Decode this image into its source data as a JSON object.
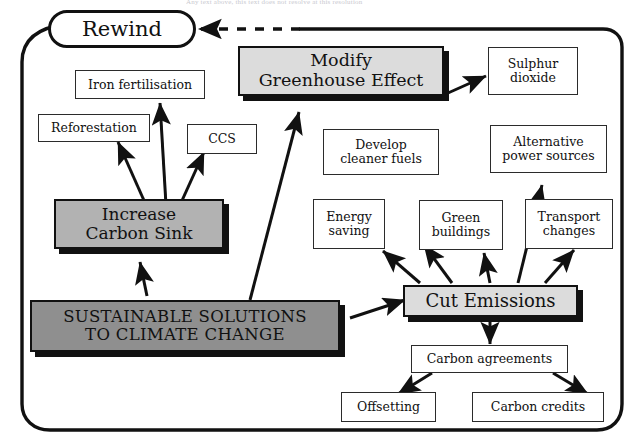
{
  "diagram": {
    "title_text": "SUSTAINABLE SOLUTIONS TO CLIMATE CHANGE",
    "top_partial_text": "Any text above, this text does not resolve at this resolution",
    "rewind_label": "Rewind",
    "colors": {
      "ink": "#111111",
      "box_white": "#ffffff",
      "tone_light": "#dcdcdc",
      "tone_mid": "#b2b2b2",
      "tone_dark": "#8f8f8f",
      "background": "#ffffff"
    },
    "nodes": {
      "modify_greenhouse": "Modify\nGreenhouse Effect",
      "modify_greenhouse_line1": "Modify",
      "modify_greenhouse_line2": "Greenhouse Effect",
      "sulphur_dioxide_line1": "Sulphur",
      "sulphur_dioxide_line2": "dioxide",
      "iron_fertilisation": "Iron fertilisation",
      "reforestation": "Reforestation",
      "ccs": "CCS",
      "increase_carbon_sink_line1": "Increase",
      "increase_carbon_sink_line2": "Carbon Sink",
      "main_line1": "SUSTAINABLE SOLUTIONS",
      "main_line2": "TO CLIMATE CHANGE",
      "develop_cleaner_fuels_line1": "Develop",
      "develop_cleaner_fuels_line2": "cleaner fuels",
      "alternative_power_line1": "Alternative",
      "alternative_power_line2": "power sources",
      "energy_saving_line1": "Energy",
      "energy_saving_line2": "saving",
      "green_buildings_line1": "Green",
      "green_buildings_line2": "buildings",
      "transport_changes_line1": "Transport",
      "transport_changes_line2": "changes",
      "cut_emissions": "Cut Emissions",
      "carbon_agreements": "Carbon agreements",
      "offsetting": "Offsetting",
      "carbon_credits": "Carbon credits"
    }
  }
}
